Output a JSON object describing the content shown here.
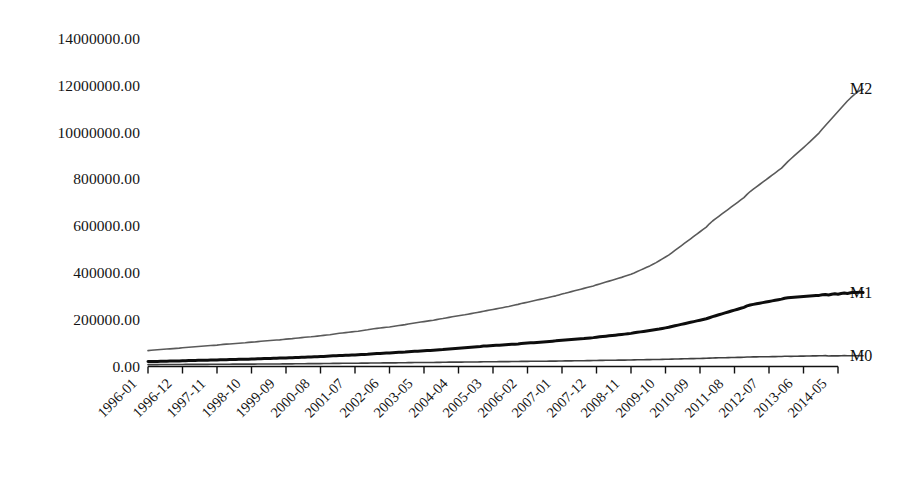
{
  "chart_data": {
    "type": "line",
    "title": "",
    "subtitle": "",
    "xlabel": "",
    "ylabel": "",
    "grid": false,
    "legend_position": "right-inline-end-of-line",
    "x_axis": {
      "tick_labels": [
        "1996-01",
        "1996-12",
        "1997-11",
        "1998-10",
        "1999-09",
        "2000-08",
        "2001-07",
        "2002-06",
        "2003-05",
        "2004-04",
        "2005-03",
        "2006-02",
        "2007-01",
        "2007-12",
        "2008-11",
        "2009-10",
        "2010-09",
        "2011-08",
        "2012-07",
        "2013-06",
        "2014-05"
      ],
      "tick_step_months": 11,
      "start": "1996-01",
      "end": "2014-05",
      "n_points": 221
    },
    "y_axis": {
      "tick_labels": [
        "14000000.00",
        "12000000.00",
        "10000000.00",
        "800000.00",
        "600000.00",
        "400000.00",
        "200000.00",
        "0.00"
      ],
      "tick_values": [
        1400000,
        1200000,
        1000000,
        800000,
        600000,
        400000,
        200000,
        0
      ],
      "ylim": [
        0,
        1400000
      ],
      "unit_note": "100 million yuan"
    },
    "series": [
      {
        "name": "M2",
        "color": "#5a5a5a",
        "width": 1.6,
        "end_value": 1185000,
        "values": [
          68000,
          69500,
          70500,
          71500,
          72500,
          73500,
          74500,
          75500,
          76500,
          77500,
          78500,
          80000,
          81500,
          82500,
          83500,
          84500,
          85500,
          86500,
          87500,
          88500,
          89500,
          90500,
          91500,
          93000,
          94500,
          95500,
          96500,
          97500,
          98500,
          99500,
          100500,
          101500,
          103000,
          104000,
          105000,
          106500,
          108000,
          109000,
          110000,
          111000,
          112000,
          113000,
          114000,
          115500,
          117000,
          118000,
          119000,
          120500,
          122000,
          123500,
          125000,
          126000,
          127000,
          128500,
          130000,
          131500,
          133000,
          134500,
          136000,
          138000,
          140000,
          142000,
          143500,
          145000,
          146500,
          148000,
          149500,
          151000,
          153000,
          155000,
          157000,
          159500,
          161500,
          163000,
          164500,
          166000,
          167500,
          169000,
          171000,
          173000,
          175000,
          177000,
          179000,
          181500,
          184000,
          186000,
          188000,
          190000,
          192000,
          194000,
          196000,
          198000,
          200500,
          203000,
          205000,
          207500,
          210000,
          212500,
          215000,
          217000,
          219000,
          221000,
          223500,
          226000,
          228500,
          231000,
          233500,
          236500,
          239000,
          241500,
          244000,
          246500,
          249000,
          251500,
          254000,
          256500,
          259500,
          262500,
          265500,
          269000,
          272000,
          275000,
          278000,
          281000,
          284000,
          287000,
          290000,
          293000,
          296000,
          299000,
          302000,
          306000,
          310000,
          313000,
          316500,
          320000,
          323500,
          327000,
          330500,
          334000,
          337500,
          341000,
          344500,
          349000,
          353000,
          357000,
          361000,
          365000,
          369000,
          373000,
          377000,
          381000,
          385500,
          390000,
          394500,
          400000,
          406000,
          412000,
          418000,
          424000,
          430000,
          437000,
          444000,
          452000,
          460000,
          468000,
          476000,
          486000,
          496000,
          506000,
          516000,
          526000,
          536000,
          546000,
          556000,
          566000,
          576000,
          586000,
          596000,
          610000,
          622000,
          632000,
          642000,
          652000,
          662000,
          672000,
          682000,
          692000,
          702000,
          712000,
          722000,
          736000,
          748000,
          758000,
          768000,
          778000,
          788000,
          798000,
          808000,
          818000,
          828000,
          838000,
          848000,
          862000,
          876000,
          888000,
          900000,
          912000,
          924000,
          936000,
          948000,
          960000,
          973000,
          986000,
          999000,
          1015000,
          1030000,
          1045000,
          1060000,
          1075000,
          1090000,
          1105000,
          1120000,
          1135000,
          1148000,
          1160000,
          1172000,
          1180000,
          1185000
        ]
      },
      {
        "name": "M1",
        "color": "#0d0d0d",
        "width": 3.0,
        "end_value": 316000,
        "values": [
          21000,
          21300,
          21600,
          21900,
          22200,
          22500,
          22800,
          23100,
          23400,
          23700,
          24000,
          24500,
          25000,
          25300,
          25600,
          25900,
          26200,
          26500,
          26800,
          27100,
          27400,
          27700,
          28000,
          28600,
          29000,
          29300,
          29600,
          29900,
          30200,
          30500,
          30800,
          31100,
          31500,
          31900,
          32300,
          33000,
          33500,
          33900,
          34300,
          34700,
          35100,
          35500,
          35900,
          36300,
          36800,
          37300,
          37800,
          38500,
          39000,
          39500,
          40000,
          40500,
          41000,
          41500,
          42000,
          42500,
          43200,
          43900,
          44600,
          45500,
          46000,
          46600,
          47200,
          47800,
          48400,
          49000,
          49600,
          50200,
          51000,
          51800,
          52600,
          53800,
          54500,
          55200,
          55900,
          56600,
          57300,
          58000,
          58800,
          59600,
          60400,
          61200,
          62000,
          63200,
          64000,
          64800,
          65600,
          66400,
          67200,
          68000,
          68800,
          69600,
          70600,
          71600,
          72600,
          74000,
          75000,
          76000,
          77000,
          78000,
          79000,
          80000,
          81000,
          82000,
          83200,
          84400,
          85600,
          87200,
          88000,
          88800,
          89600,
          90400,
          91200,
          92000,
          92800,
          93600,
          94600,
          95600,
          96600,
          98000,
          99000,
          100000,
          101000,
          102000,
          103000,
          104000,
          105000,
          106000,
          107200,
          108400,
          109600,
          111200,
          112500,
          113500,
          114500,
          115500,
          116500,
          117500,
          118500,
          119500,
          120800,
          122100,
          123400,
          125200,
          127000,
          128400,
          129800,
          131200,
          132600,
          134000,
          135400,
          136800,
          138400,
          140000,
          141600,
          144000,
          146000,
          148000,
          150000,
          152000,
          154000,
          156000,
          158000,
          160000,
          162500,
          165000,
          167500,
          171000,
          174000,
          177000,
          180000,
          183000,
          186000,
          189000,
          192000,
          195000,
          198000,
          201000,
          204000,
          208500,
          213000,
          217000,
          221000,
          225000,
          229000,
          233000,
          237000,
          241000,
          245000,
          249000,
          253000,
          259000,
          263000,
          265500,
          268000,
          270500,
          273000,
          275500,
          278000,
          280500,
          283000,
          285500,
          288000,
          292000,
          294000,
          295000,
          296000,
          297000,
          298000,
          299000,
          300000,
          301000,
          302000,
          303000,
          304000,
          306500,
          308000,
          306000,
          309000,
          311000,
          309000,
          312000,
          314000,
          312000,
          315000,
          317000,
          316000,
          318000,
          316000
        ]
      },
      {
        "name": "M0",
        "color": "#3f3f3f",
        "width": 1.6,
        "end_value": 46000,
        "values": [
          8000,
          8100,
          8150,
          8200,
          8250,
          8300,
          8350,
          8400,
          8450,
          8500,
          8550,
          8700,
          8900,
          8950,
          9000,
          9050,
          9100,
          9150,
          9200,
          9250,
          9300,
          9350,
          9400,
          9600,
          9800,
          9850,
          9900,
          9950,
          10000,
          10050,
          10100,
          10150,
          10200,
          10250,
          10300,
          10500,
          10700,
          10750,
          10800,
          10850,
          10900,
          10950,
          11000,
          11050,
          11150,
          11250,
          11350,
          11600,
          11800,
          11900,
          12000,
          12100,
          12200,
          12300,
          12400,
          12500,
          12650,
          12800,
          12950,
          13200,
          13400,
          13500,
          13600,
          13700,
          13800,
          13900,
          14000,
          14100,
          14250,
          14400,
          14550,
          14800,
          15000,
          15100,
          15200,
          15300,
          15400,
          15500,
          15600,
          15700,
          15850,
          16000,
          16150,
          16500,
          16700,
          16800,
          16900,
          17000,
          17100,
          17200,
          17300,
          17400,
          17550,
          17700,
          17850,
          18200,
          18500,
          18600,
          18700,
          18800,
          18900,
          19000,
          19100,
          19200,
          19350,
          19500,
          19650,
          20000,
          20300,
          20400,
          20500,
          20600,
          20700,
          20800,
          20900,
          21000,
          21150,
          21300,
          21450,
          21800,
          22000,
          22100,
          22200,
          22300,
          22400,
          22500,
          22600,
          22700,
          22850,
          23000,
          23150,
          23500,
          23800,
          23950,
          24100,
          24250,
          24400,
          24550,
          24700,
          24850,
          25050,
          25250,
          25450,
          25900,
          26200,
          26350,
          26500,
          26650,
          26800,
          26950,
          27100,
          27250,
          27450,
          27650,
          27850,
          28300,
          28700,
          28900,
          29100,
          29300,
          29500,
          29700,
          29900,
          30100,
          30400,
          30700,
          31000,
          31600,
          32000,
          32300,
          32600,
          32900,
          33200,
          33500,
          33800,
          34100,
          34400,
          34700,
          35000,
          35800,
          36500,
          36800,
          37100,
          37400,
          37700,
          38000,
          38300,
          38600,
          38900,
          39200,
          39500,
          40300,
          40800,
          41000,
          41200,
          41400,
          41600,
          41800,
          42000,
          42200,
          42400,
          42600,
          42800,
          43500,
          43800,
          43300,
          43600,
          43900,
          44200,
          44500,
          44800,
          45100,
          45300,
          45500,
          45700,
          46200,
          46500,
          45200,
          45600,
          45900,
          45500,
          46000,
          46300,
          45900,
          46200,
          46500,
          46100,
          46500,
          46000
        ]
      }
    ]
  },
  "series_labels": [
    {
      "name": "M2",
      "text": "M2"
    },
    {
      "name": "M1",
      "text": "M1"
    },
    {
      "name": "M0",
      "text": "M0"
    }
  ],
  "colors": {
    "background": "#ffffff",
    "axis": "#111111",
    "m2": "#5a5a5a",
    "m1": "#0d0d0d",
    "m0": "#3f3f3f"
  }
}
